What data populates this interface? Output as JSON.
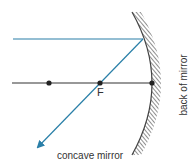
{
  "diagram": {
    "labels": {
      "focal_point": "F",
      "mirror": "concave mirror",
      "back": "back of mirror"
    },
    "colors": {
      "ray": "#2a7fa8",
      "axis": "#333333",
      "mirror_hatch": "#444444"
    },
    "elements": {
      "principal_axis": {
        "from": [
          12,
          83
        ],
        "to": [
          152,
          83
        ]
      },
      "points": [
        {
          "name": "center-of-curvature",
          "x": 49,
          "y": 83
        },
        {
          "name": "focal-point",
          "x": 100,
          "y": 83,
          "label": "F"
        },
        {
          "name": "pole",
          "x": 152,
          "y": 83
        }
      ],
      "incident_ray": {
        "from": [
          13,
          39
        ],
        "to": [
          143,
          39
        ]
      },
      "reflected_ray": {
        "from": [
          143,
          39
        ],
        "to": [
          36,
          149
        ]
      }
    }
  }
}
